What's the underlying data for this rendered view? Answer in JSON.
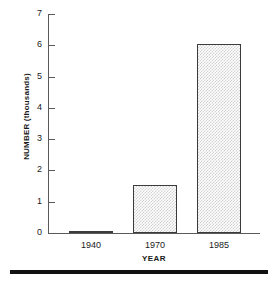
{
  "chart_data": {
    "type": "bar",
    "title": "",
    "subtitle": "",
    "xlabel": "YEAR",
    "ylabel": "NUMBER (thousands)",
    "categories": [
      "1940",
      "1970",
      "1985"
    ],
    "values": [
      0.07,
      1.55,
      6.05
    ],
    "series": [
      {
        "name": "NUMBER (thousands)",
        "values": [
          0.07,
          1.55,
          6.05
        ]
      }
    ],
    "ylim": [
      0,
      7
    ],
    "yticks": [
      0,
      1,
      2,
      3,
      4,
      5,
      6,
      7
    ],
    "ytick_labels": [
      "0",
      "1",
      "2",
      "3",
      "4",
      "5",
      "6",
      "7"
    ],
    "xtick_labels": [
      "1940",
      "1970",
      "1985"
    ],
    "grid": false,
    "legend": false,
    "legend_position": "none",
    "bar_fill": "#d2d2d2",
    "bar_edge": "#3b3b3b",
    "axis_color": "#5a5a5a",
    "text_color": "#1a1a1a",
    "rule_color": "#111111",
    "annotations": []
  },
  "figure": {
    "bottom_rule_name": "bottom-rule"
  }
}
